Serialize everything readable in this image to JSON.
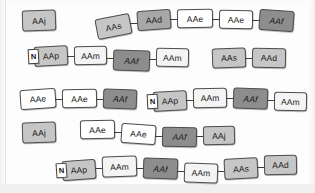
{
  "diagram": {
    "background_color": "#fdfdfd",
    "node_fill_colors": {
      "white": "#ffffff",
      "near_white": "#f4f4f4",
      "light_gray": "#c6c6c6",
      "mid_gray": "#a8a8a8",
      "dark_gray": "#8d8d8d"
    },
    "border_color": "#4d4d4d",
    "link_color": "#3d3d3d",
    "tag_label": "N",
    "rows": [
      {
        "row_index": 1,
        "groups": [
          {
            "nodes": [
              {
                "label": "AAj",
                "fill": "light_gray"
              }
            ]
          },
          {
            "nodes": [
              {
                "label": "AAs",
                "fill": "light_gray"
              },
              {
                "label": "AAd",
                "fill": "mid_gray"
              },
              {
                "label": "AAe",
                "fill": "white"
              },
              {
                "label": "AAe",
                "fill": "white"
              },
              {
                "label": "AAf",
                "fill": "dark_gray"
              }
            ]
          }
        ]
      },
      {
        "row_index": 2,
        "groups": [
          {
            "nodes": [
              {
                "label": "AAp",
                "fill": "light_gray",
                "tag": "N"
              },
              {
                "label": "AAm",
                "fill": "near_white"
              },
              {
                "label": "AAf",
                "fill": "dark_gray"
              },
              {
                "label": "AAm",
                "fill": "near_white"
              }
            ]
          },
          {
            "nodes": [
              {
                "label": "AAs",
                "fill": "light_gray"
              },
              {
                "label": "AAd",
                "fill": "light_gray"
              }
            ]
          }
        ]
      },
      {
        "row_index": 3,
        "groups": [
          {
            "nodes": [
              {
                "label": "AAe",
                "fill": "white"
              },
              {
                "label": "AAe",
                "fill": "white"
              },
              {
                "label": "AAf",
                "fill": "dark_gray"
              }
            ]
          },
          {
            "nodes": [
              {
                "label": "AAp",
                "fill": "light_gray",
                "tag": "N"
              },
              {
                "label": "AAm",
                "fill": "near_white"
              },
              {
                "label": "AAf",
                "fill": "dark_gray"
              },
              {
                "label": "AAm",
                "fill": "near_white"
              }
            ]
          }
        ]
      },
      {
        "row_index": 4,
        "groups": [
          {
            "nodes": [
              {
                "label": "AAj",
                "fill": "light_gray"
              }
            ]
          },
          {
            "nodes": [
              {
                "label": "AAe",
                "fill": "white"
              },
              {
                "label": "AAe",
                "fill": "white"
              },
              {
                "label": "AAf",
                "fill": "dark_gray"
              },
              {
                "label": "AAj",
                "fill": "light_gray"
              }
            ]
          }
        ]
      },
      {
        "row_index": 5,
        "groups": [
          {
            "nodes": [
              {
                "label": "AAp",
                "fill": "light_gray",
                "tag": "N"
              },
              {
                "label": "AAm",
                "fill": "near_white"
              },
              {
                "label": "AAf",
                "fill": "dark_gray"
              },
              {
                "label": "AAm",
                "fill": "near_white"
              },
              {
                "label": "AAs",
                "fill": "light_gray"
              },
              {
                "label": "AAd",
                "fill": "light_gray"
              }
            ]
          }
        ]
      }
    ]
  }
}
